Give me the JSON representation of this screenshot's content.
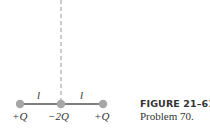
{
  "figure": {
    "caption": {
      "title": "FIGURE 21–61",
      "subtitle": "Problem 70."
    },
    "charges": [
      {
        "label": "+Q",
        "x": 20
      },
      {
        "label": "−2Q",
        "x": 61
      },
      {
        "label": "+Q",
        "x": 103
      }
    ],
    "spacing_labels": [
      "l",
      "l"
    ],
    "colors": {
      "charge_dot": "#a6a6a6",
      "line": "#555555",
      "dashed_axis": "#9a9a9a",
      "text": "#333333"
    }
  }
}
